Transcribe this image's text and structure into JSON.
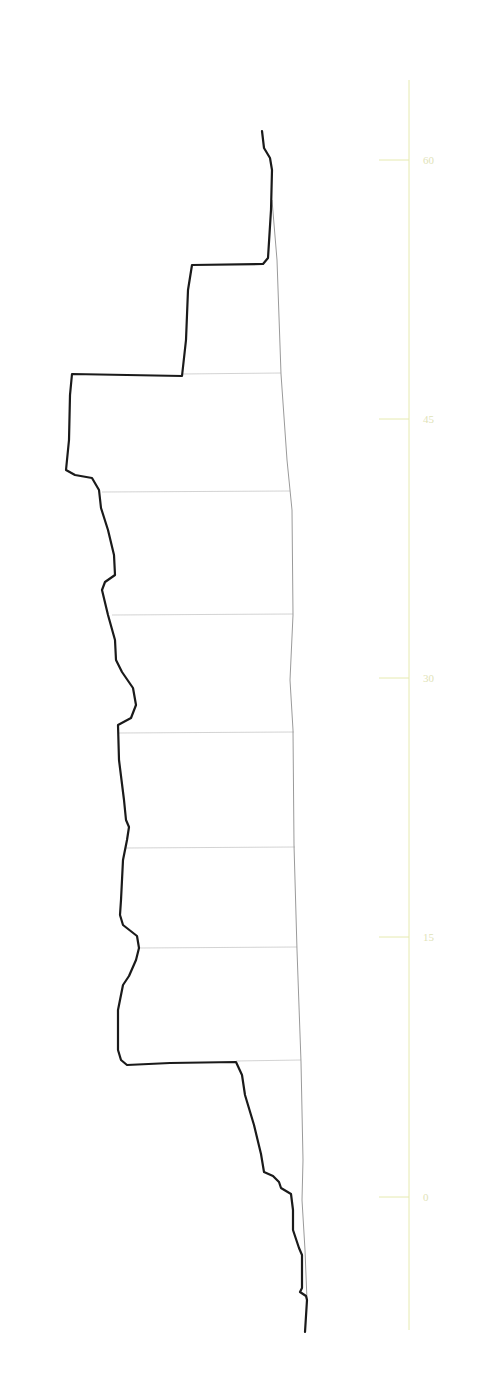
{
  "chart_data": {
    "type": "line",
    "title": "",
    "xlabel": "",
    "ylabel": "",
    "orientation": "vertical-profile",
    "y_axis": {
      "position": "right",
      "ticks": [
        0,
        15,
        30,
        45,
        60
      ],
      "tick_labels": [
        "0",
        "15",
        "30",
        "45",
        "60"
      ],
      "range": [
        -6.9,
        64.7
      ],
      "color": "#e6eab0"
    },
    "grid": false,
    "legend": null,
    "series": [
      {
        "name": "profile",
        "style": "thick-black",
        "color": "#1a1a1a",
        "points_xy_px": [
          [
            262,
            131
          ],
          [
            264,
            148
          ],
          [
            270,
            158
          ],
          [
            272,
            170
          ],
          [
            271,
            210
          ],
          [
            268,
            258
          ],
          [
            263,
            264
          ],
          [
            192,
            265
          ],
          [
            188,
            290
          ],
          [
            186,
            340
          ],
          [
            182,
            376
          ],
          [
            72,
            374
          ],
          [
            70,
            395
          ],
          [
            69,
            440
          ],
          [
            66,
            470
          ],
          [
            75,
            475
          ],
          [
            92,
            478
          ],
          [
            99,
            490
          ],
          [
            101,
            508
          ],
          [
            108,
            530
          ],
          [
            114,
            555
          ],
          [
            115,
            575
          ],
          [
            105,
            582
          ],
          [
            102,
            590
          ],
          [
            108,
            615
          ],
          [
            115,
            640
          ],
          [
            116,
            660
          ],
          [
            122,
            672
          ],
          [
            133,
            688
          ],
          [
            136,
            705
          ],
          [
            131,
            718
          ],
          [
            118,
            725
          ],
          [
            119,
            760
          ],
          [
            124,
            800
          ],
          [
            126,
            820
          ],
          [
            129,
            827
          ],
          [
            127,
            840
          ],
          [
            123,
            860
          ],
          [
            121,
            900
          ],
          [
            120,
            915
          ],
          [
            123,
            925
          ],
          [
            137,
            936
          ],
          [
            139,
            948
          ],
          [
            136,
            960
          ],
          [
            129,
            976
          ],
          [
            123,
            985
          ],
          [
            118,
            1010
          ],
          [
            118,
            1050
          ],
          [
            121,
            1060
          ],
          [
            127,
            1065
          ],
          [
            170,
            1063
          ],
          [
            236,
            1062
          ],
          [
            242,
            1075
          ],
          [
            245,
            1095
          ],
          [
            254,
            1125
          ],
          [
            261,
            1154
          ],
          [
            264,
            1172
          ],
          [
            273,
            1176
          ],
          [
            279,
            1182
          ],
          [
            281,
            1188
          ],
          [
            291,
            1194
          ],
          [
            293,
            1210
          ],
          [
            293,
            1230
          ],
          [
            299,
            1248
          ],
          [
            302,
            1255
          ],
          [
            302,
            1288
          ],
          [
            300,
            1292
          ],
          [
            306,
            1296
          ],
          [
            307,
            1300
          ],
          [
            305,
            1332
          ]
        ]
      },
      {
        "name": "baseline",
        "style": "thin-grey",
        "color": "#9a9a9a",
        "points_xy_px": [
          [
            272,
            200
          ],
          [
            277,
            260
          ],
          [
            281,
            374
          ],
          [
            287,
            460
          ],
          [
            292,
            510
          ],
          [
            293,
            615
          ],
          [
            290,
            680
          ],
          [
            293,
            730
          ],
          [
            294,
            845
          ],
          [
            297,
            950
          ],
          [
            301,
            1062
          ],
          [
            303,
            1160
          ],
          [
            302,
            1200
          ],
          [
            305,
            1250
          ],
          [
            307,
            1300
          ]
        ]
      }
    ],
    "dividers": [
      {
        "y_px": 374,
        "x_from": 182,
        "x_to": 281
      },
      {
        "y_px": 492,
        "x_from": 102,
        "x_to": 290
      },
      {
        "y_px": 615,
        "x_from": 112,
        "x_to": 293
      },
      {
        "y_px": 733,
        "x_from": 119,
        "x_to": 294
      },
      {
        "y_px": 848,
        "x_from": 126,
        "x_to": 295
      },
      {
        "y_px": 948,
        "x_from": 139,
        "x_to": 297
      },
      {
        "y_px": 1061,
        "x_from": 236,
        "x_to": 301
      }
    ],
    "divider_values": [
      46.8,
      40.0,
      32.8,
      26.0,
      19.3,
      13.5,
      7.0
    ],
    "profile_extent_values": {
      "top": 62.2,
      "bottom": -7.8
    }
  },
  "axis": {
    "line": {
      "x": 409,
      "y_top": 80,
      "y_bottom": 1330
    },
    "tick_mark_length": 30,
    "ticks": [
      {
        "label": "60",
        "y": 160
      },
      {
        "label": "45",
        "y": 419
      },
      {
        "label": "30",
        "y": 678
      },
      {
        "label": "15",
        "y": 937
      },
      {
        "label": "0",
        "y": 1197
      }
    ]
  },
  "colors": {
    "background": "#ffffff",
    "profile": "#1a1a1a",
    "baseline": "#9a9a9a",
    "divider": "#c8c8c8",
    "axis": "#e6eab0",
    "tick_label": "#dfe3b8"
  }
}
